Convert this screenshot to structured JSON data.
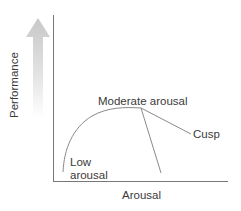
{
  "diagram": {
    "title": "",
    "type": "inverted-U with cusp (performance vs. arousal)",
    "axes": {
      "x_label": "Arousal",
      "y_label": "Performance"
    },
    "labels": {
      "low": "Low\narousal",
      "low_line1": "Low",
      "low_line2": "arousal",
      "moderate": "Moderate arousal",
      "cusp": "Cusp"
    },
    "colors": {
      "axis": "#777777",
      "curve": "#8a8a8a",
      "arrow_top": "#c8c8c8",
      "arrow_bottom": "#ffffff",
      "text": "#3a3a3a"
    }
  }
}
